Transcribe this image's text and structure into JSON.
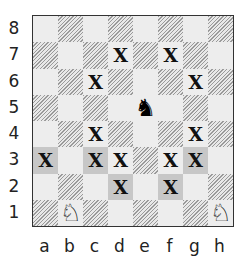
{
  "board": {
    "ranks": [
      "8",
      "7",
      "6",
      "5",
      "4",
      "3",
      "2",
      "1"
    ],
    "files": [
      "a",
      "b",
      "c",
      "d",
      "e",
      "f",
      "g",
      "h"
    ],
    "colors": {
      "light": "#ededed",
      "dark_hatched": "#9a9a9a",
      "highlight": "#c7c7c7"
    },
    "squares": [
      [
        "light",
        "dark",
        "light",
        "dark",
        "light",
        "dark",
        "light",
        "dark"
      ],
      [
        "dark",
        "light",
        "dark",
        "light",
        "dark",
        "light",
        "dark",
        "light"
      ],
      [
        "light",
        "dark",
        "light",
        "dark",
        "light",
        "dark",
        "light",
        "dark"
      ],
      [
        "dark",
        "light",
        "dark",
        "light",
        "light",
        "light",
        "dark",
        "light"
      ],
      [
        "light",
        "dark",
        "light",
        "dark",
        "light",
        "dark",
        "light",
        "dark"
      ],
      [
        "hl",
        "light",
        "hl",
        "light",
        "dark",
        "light",
        "hl",
        "light"
      ],
      [
        "light",
        "dark",
        "light",
        "hl",
        "light",
        "hl",
        "light",
        "dark"
      ],
      [
        "dark",
        "light",
        "dark",
        "light",
        "dark",
        "light",
        "dark",
        "light"
      ]
    ],
    "contents": [
      [
        "",
        "",
        "",
        "",
        "",
        "",
        "",
        ""
      ],
      [
        "",
        "",
        "",
        "X",
        "",
        "X",
        "",
        ""
      ],
      [
        "",
        "",
        "X",
        "",
        "",
        "",
        "X",
        ""
      ],
      [
        "",
        "",
        "",
        "",
        "bN",
        "",
        "",
        ""
      ],
      [
        "",
        "",
        "X",
        "",
        "",
        "",
        "X",
        ""
      ],
      [
        "X",
        "",
        "X",
        "X",
        "",
        "X",
        "X",
        ""
      ],
      [
        "",
        "",
        "",
        "X",
        "",
        "X",
        "",
        ""
      ],
      [
        "",
        "wN",
        "",
        "",
        "",
        "",
        "",
        "wN"
      ]
    ],
    "pieces": {
      "bN": {
        "glyph": "♞",
        "name": "black-knight",
        "square": "e5"
      },
      "wN": {
        "glyph": "♘",
        "name": "white-knight",
        "squares": [
          "b1",
          "h1"
        ]
      }
    },
    "marked_squares": [
      "d7",
      "f7",
      "c6",
      "g6",
      "c4",
      "g4",
      "a3",
      "c3",
      "d3",
      "f3",
      "g3",
      "d2",
      "f2"
    ],
    "mark_symbol": "X"
  }
}
